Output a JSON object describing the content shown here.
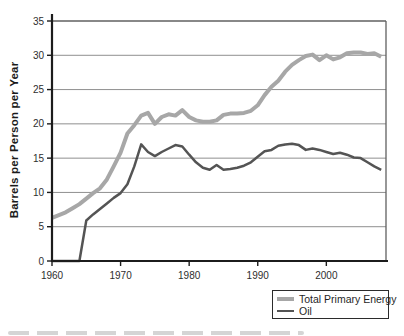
{
  "figure": {
    "background_color": "#ffffff",
    "axis_color": "#1c1c1c",
    "border_color": "#606060",
    "gridline_color": "#8f8f8f",
    "tick_text_color": "#2e2e2e"
  },
  "chart_data": {
    "type": "line",
    "title": "",
    "xlabel": "",
    "ylabel": "Barrels per Person per Year",
    "xlim": [
      1960,
      2008.7
    ],
    "ylim": [
      0,
      35
    ],
    "x_ticks": [
      1960,
      1970,
      1980,
      1990,
      2000
    ],
    "y_ticks": [
      0,
      5,
      10,
      15,
      20,
      25,
      30,
      35
    ],
    "grid": "horizontal",
    "legend": {
      "position": "bottom-right-below-plot",
      "items": [
        "Total Primary Energy",
        "Oil"
      ]
    },
    "x": [
      1960,
      1961,
      1962,
      1963,
      1964,
      1965,
      1966,
      1967,
      1968,
      1969,
      1970,
      1971,
      1972,
      1973,
      1974,
      1975,
      1976,
      1977,
      1978,
      1979,
      1980,
      1981,
      1982,
      1983,
      1984,
      1985,
      1986,
      1987,
      1988,
      1989,
      1990,
      1991,
      1992,
      1993,
      1994,
      1995,
      1996,
      1997,
      1998,
      1999,
      2000,
      2001,
      2002,
      2003,
      2004,
      2005,
      2006,
      2007,
      2008
    ],
    "series": [
      {
        "name": "Total Primary Energy",
        "color": "#a7a7a7",
        "line_width": 4,
        "values": [
          6.3,
          6.7,
          7.1,
          7.7,
          8.3,
          9.1,
          9.9,
          10.6,
          11.9,
          13.8,
          15.8,
          18.6,
          19.8,
          21.2,
          21.6,
          20.0,
          21.0,
          21.4,
          21.2,
          22.0,
          21.0,
          20.5,
          20.3,
          20.3,
          20.5,
          21.3,
          21.5,
          21.5,
          21.6,
          21.9,
          22.7,
          24.2,
          25.4,
          26.3,
          27.6,
          28.6,
          29.3,
          29.9,
          30.1,
          29.3,
          30.0,
          29.4,
          29.7,
          30.3,
          30.4,
          30.4,
          30.2,
          30.3,
          29.8
        ]
      },
      {
        "name": "Oil",
        "color": "#545454",
        "line_width": 2.5,
        "values": [
          0,
          0,
          0,
          0,
          0,
          5.9,
          6.8,
          7.6,
          8.4,
          9.2,
          9.9,
          11.2,
          13.8,
          17.0,
          15.9,
          15.3,
          15.9,
          16.4,
          16.9,
          16.7,
          15.5,
          14.4,
          13.6,
          13.3,
          14.0,
          13.3,
          13.4,
          13.6,
          13.9,
          14.4,
          15.2,
          16.0,
          16.2,
          16.8,
          17.0,
          17.1,
          16.9,
          16.2,
          16.4,
          16.2,
          15.9,
          15.6,
          15.8,
          15.5,
          15.1,
          15.0,
          14.4,
          13.8,
          13.3
        ]
      }
    ]
  }
}
